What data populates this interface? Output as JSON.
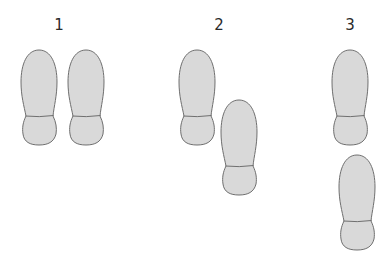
{
  "diagram": {
    "colors": {
      "fill": "#d9d9d9",
      "stroke": "#6f6f6f",
      "label": "#2a2a2a"
    },
    "steps": [
      {
        "label": "1",
        "label_x": 59
      },
      {
        "label": "2",
        "label_x": 219
      },
      {
        "label": "3",
        "label_x": 350
      }
    ],
    "shoes": [
      {
        "step": 1,
        "x": 21,
        "y": 50
      },
      {
        "step": 1,
        "x": 68,
        "y": 50
      },
      {
        "step": 2,
        "x": 179,
        "y": 50
      },
      {
        "step": 2,
        "x": 221,
        "y": 100
      },
      {
        "step": 3,
        "x": 332,
        "y": 50
      },
      {
        "step": 3,
        "x": 339,
        "y": 155
      }
    ]
  }
}
